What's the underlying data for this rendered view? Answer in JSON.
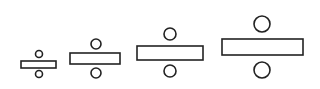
{
  "figure": {
    "stroke_color": "#222222",
    "fill_color": "#ffffff",
    "symbols": [
      {
        "name": "division-sign-small",
        "bar": {
          "x": 21,
          "y": 61,
          "w": 35,
          "h": 7
        },
        "top_dot": {
          "cx": 39,
          "cy": 54,
          "r": 3.5
        },
        "bottom_dot": {
          "cx": 39,
          "cy": 74,
          "r": 3.5
        }
      },
      {
        "name": "division-sign-medium",
        "bar": {
          "x": 70,
          "y": 53,
          "w": 50,
          "h": 11
        },
        "top_dot": {
          "cx": 96,
          "cy": 44,
          "r": 5
        },
        "bottom_dot": {
          "cx": 96,
          "cy": 73,
          "r": 5
        }
      },
      {
        "name": "division-sign-large",
        "bar": {
          "x": 137,
          "y": 46,
          "w": 66,
          "h": 14
        },
        "top_dot": {
          "cx": 170,
          "cy": 34,
          "r": 6
        },
        "bottom_dot": {
          "cx": 170,
          "cy": 71,
          "r": 6
        }
      },
      {
        "name": "division-sign-xlarge",
        "bar": {
          "x": 222,
          "y": 39,
          "w": 81,
          "h": 16
        },
        "top_dot": {
          "cx": 262,
          "cy": 24,
          "r": 8
        },
        "bottom_dot": {
          "cx": 262,
          "cy": 70,
          "r": 8
        }
      }
    ]
  }
}
